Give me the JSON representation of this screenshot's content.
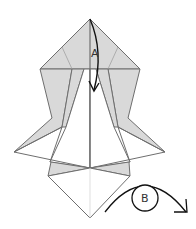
{
  "diagram": {
    "type": "origami-fold-step",
    "colors": {
      "fill": "#d9d9d9",
      "line": "#6e6e6e",
      "arrow": "#111111",
      "background": "#ffffff"
    },
    "labels": {
      "a": "A",
      "b": "B"
    },
    "arrows": [
      {
        "id": "A",
        "kind": "valley-fold-down",
        "description": "Fold top point down along center"
      },
      {
        "id": "B",
        "kind": "turn-over",
        "description": "Turn model over"
      }
    ]
  }
}
